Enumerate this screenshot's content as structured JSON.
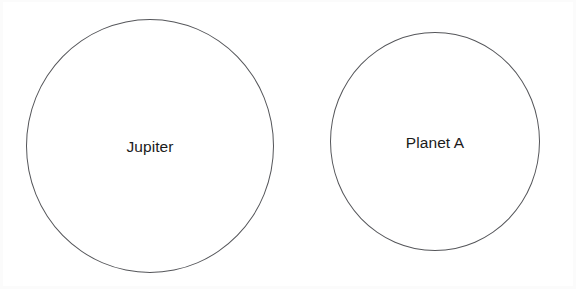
{
  "figure": {
    "type": "diagram",
    "subtype": "two-circle-size-comparison",
    "background_color": "#ffffff",
    "stroke_color": "#55565a",
    "label_color": "#1b1b1b",
    "shapes": [
      {
        "id": "jupiter",
        "shape": "circle",
        "label": "Jupiter",
        "center_x": 150,
        "center_y": 146,
        "diameter": 248,
        "fill": "none",
        "stroke": "#55565a",
        "stroke_width": 1.5
      },
      {
        "id": "planet-a",
        "shape": "circle",
        "label": "Planet A",
        "center_x": 435,
        "center_y": 142,
        "diameter": 210,
        "fill": "none",
        "stroke": "#55565a",
        "stroke_width": 1.5
      }
    ]
  }
}
